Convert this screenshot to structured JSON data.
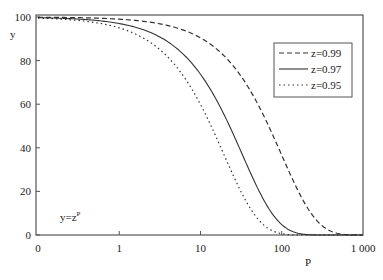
{
  "chart_data": {
    "type": "line",
    "title": "",
    "xlabel": "P",
    "ylabel": "y",
    "annotation": "y=z^P",
    "annotation_display": "y=z",
    "annotation_sup": "P",
    "x_scale": "log",
    "x_ticks": [
      "0",
      "1",
      "10",
      "100",
      "1 000"
    ],
    "y_ticks": [
      "0",
      "20",
      "40",
      "60",
      "80",
      "100"
    ],
    "ylim": [
      0,
      100
    ],
    "grid": false,
    "legend_position": "upper right",
    "x": [
      0.1,
      0.2,
      0.5,
      1,
      2,
      3,
      5,
      7,
      10,
      15,
      20,
      30,
      50,
      70,
      100,
      150,
      200,
      300,
      500,
      700,
      1000
    ],
    "series": [
      {
        "name": "z=0.99",
        "style": "dashed",
        "z": 0.99,
        "values": [
          99.9,
          99.8,
          99.5,
          99.0,
          98.0,
          97.0,
          95.1,
          93.2,
          90.4,
          86.0,
          81.8,
          74.0,
          60.5,
          49.5,
          36.6,
          22.1,
          13.4,
          4.9,
          0.7,
          0.1,
          0.0
        ]
      },
      {
        "name": "z=0.97",
        "style": "solid",
        "z": 0.97,
        "values": [
          99.7,
          99.4,
          98.5,
          97.0,
          94.1,
          91.3,
          85.9,
          80.8,
          73.7,
          63.3,
          54.4,
          40.1,
          21.8,
          11.9,
          4.8,
          1.0,
          0.2,
          0.0,
          0.0,
          0.0,
          0.0
        ]
      },
      {
        "name": "z=0.95",
        "style": "dotted",
        "z": 0.95,
        "values": [
          99.5,
          99.0,
          97.5,
          95.0,
          90.3,
          85.7,
          77.4,
          69.8,
          59.9,
          46.3,
          35.8,
          21.5,
          7.7,
          2.8,
          0.6,
          0.0,
          0.0,
          0.0,
          0.0,
          0.0,
          0.0
        ]
      }
    ]
  }
}
